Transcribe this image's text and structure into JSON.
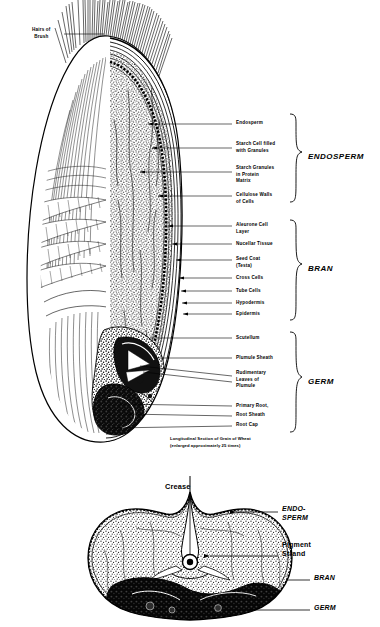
{
  "figure": {
    "caption": "Longitudinal Section of Grain of Wheat\n(enlarged approximately 25 times)"
  },
  "longitudinal": {
    "brush_label": "Hairs of\nBrush",
    "groups": [
      {
        "name": "ENDOSPERM",
        "label": "ENDOSPERM"
      },
      {
        "name": "BRAN",
        "label": "BRAN"
      },
      {
        "name": "GERM",
        "label": "GERM"
      }
    ],
    "endosperm_parts": [
      {
        "label": "Endosperm"
      },
      {
        "label": "Starch Cell filled\nwith Granules"
      },
      {
        "label": "Starch Granules\nin Protein\nMatrix"
      },
      {
        "label": "Cellulose Walls\nof Cells"
      }
    ],
    "bran_parts": [
      {
        "label": "Aleurone Cell\nLayer"
      },
      {
        "label": "Nucellar Tissue"
      },
      {
        "label": "Seed Coat\n(Testa)"
      },
      {
        "label": "Cross Cells"
      },
      {
        "label": "Tube Cells"
      },
      {
        "label": "Hypodermis"
      },
      {
        "label": "Epidermis"
      }
    ],
    "germ_parts": [
      {
        "label": "Scutellum"
      },
      {
        "label": "Plumule Sheath"
      },
      {
        "label": "Rudimentary\nLeaves of\nPlumule"
      },
      {
        "label": "Primary Root,"
      },
      {
        "label": "Root Sheath"
      },
      {
        "label": "Root Cap"
      }
    ]
  },
  "cross_section": {
    "crease_label": "Crease",
    "labels": [
      {
        "label": "ENDO-\nSPERM",
        "style": "italic"
      },
      {
        "label": "Pigment\nStrand",
        "style": "upright"
      },
      {
        "label": "BRAN",
        "style": "italic"
      },
      {
        "label": "GERM",
        "style": "italic"
      }
    ]
  },
  "colors": {
    "ink": "#000000",
    "paper": "#ffffff"
  }
}
